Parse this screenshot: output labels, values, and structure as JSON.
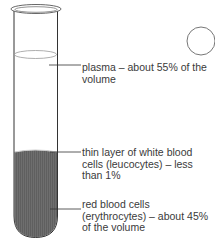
{
  "diagram": {
    "labels": {
      "plasma": "plasma – about 55% of the volume",
      "white_cells": "thin layer of white blood cells (leucocytes) – less than 1%",
      "red_cells": "red blood cells (erythrocytes) – about 45% of the volume"
    },
    "colors": {
      "outline": "#333333",
      "red_cells_fill": "#6e6e6e",
      "leader_line": "#333333",
      "text": "#3a3a3a"
    },
    "decoration": "circle-marker"
  }
}
